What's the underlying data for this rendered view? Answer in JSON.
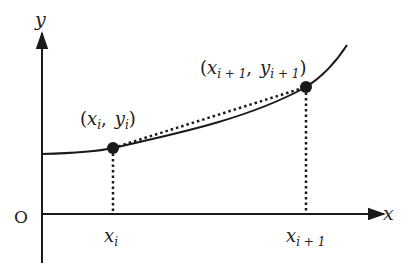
{
  "diagram": {
    "axes": {
      "x_label": "x",
      "y_label": "y",
      "origin_label": "O"
    },
    "points": [
      {
        "name": "P_i",
        "label_var_x": "x",
        "label_var_y": "y",
        "sub": "i",
        "tick_label_base": "x",
        "tick_label_sub": "i"
      },
      {
        "name": "P_i+1",
        "label_var_x": "x",
        "label_var_y": "y",
        "sub": "i + 1",
        "tick_label_base": "x",
        "tick_label_sub": "i + 1"
      }
    ],
    "punct": {
      "open": "(",
      "close": ")",
      "comma": ","
    },
    "colors": {
      "stroke": "#1a1a1a",
      "background": "#ffffff"
    }
  }
}
